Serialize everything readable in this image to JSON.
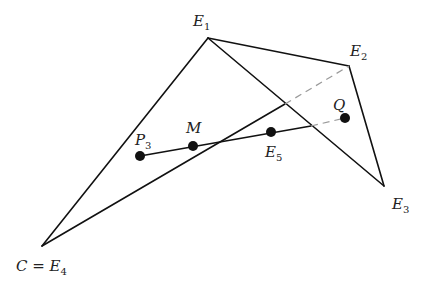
{
  "diagram": {
    "colors": {
      "edge": "#111111",
      "dashed": "#9a9a9a",
      "point": "#111111",
      "label": "#222222"
    },
    "vertices": {
      "E1": {
        "x": 208,
        "y": 38
      },
      "E2": {
        "x": 349,
        "y": 66
      },
      "E3": {
        "x": 384,
        "y": 186
      },
      "E4": {
        "x": 42,
        "y": 246
      }
    },
    "points": {
      "P3": {
        "x": 140,
        "y": 156
      },
      "M": {
        "x": 193,
        "y": 146
      },
      "E5": {
        "x": 271,
        "y": 132
      },
      "Q": {
        "x": 345,
        "y": 118
      }
    },
    "labels": {
      "E1": {
        "main": "E",
        "sub": "1"
      },
      "E2": {
        "main": "E",
        "sub": "2"
      },
      "E3": {
        "main": "E",
        "sub": "3"
      },
      "E4": {
        "main": "C = E",
        "sub": "4"
      },
      "P3": {
        "main": "P",
        "sub": "3"
      },
      "M": {
        "main": "M",
        "sub": ""
      },
      "E5": {
        "main": "E",
        "sub": "5"
      },
      "Q": {
        "main": "Q",
        "sub": ""
      }
    },
    "segments": {
      "solid": [
        "E1-E2",
        "E2-E3",
        "E3-E1",
        "E1-E4",
        "E4-crossing1",
        "P3-crossing2"
      ],
      "dashed": [
        "crossing1-E2",
        "crossing2-Q"
      ]
    }
  }
}
